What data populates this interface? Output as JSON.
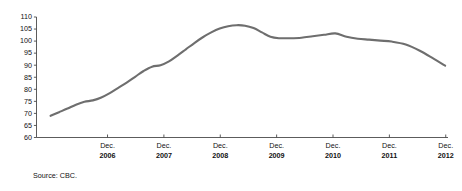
{
  "chart_data": {
    "type": "line",
    "title": "",
    "subtitle": "",
    "xlabel": "",
    "ylabel": "",
    "ylim": [
      60,
      110
    ],
    "yticks": [
      60,
      65,
      70,
      75,
      80,
      85,
      90,
      95,
      100,
      105,
      110
    ],
    "grid": false,
    "legend": null,
    "legend_position": "none",
    "line_color": "#6e6e6e",
    "axis_color": "#4a4a4a",
    "text_color": "#111111",
    "xtick_month": "Dec.",
    "xtick_years": [
      "2006",
      "2007",
      "2008",
      "2009",
      "2010",
      "2011",
      "2012"
    ],
    "x_axis_range_label": [
      "2006",
      "2012"
    ],
    "annotations": [
      {
        "text": "Source: CBC."
      }
    ],
    "series": [
      {
        "name": "index",
        "x": [
          2005.95,
          2006.1,
          2006.25,
          2006.4,
          2006.55,
          2006.7,
          2006.85,
          2007.0,
          2007.15,
          2007.3,
          2007.45,
          2007.6,
          2007.75,
          2007.9,
          2008.05,
          2008.2,
          2008.35,
          2008.5,
          2008.65,
          2008.8,
          2008.95,
          2009.1,
          2009.25,
          2009.4,
          2009.55,
          2009.7,
          2009.85,
          2010.0,
          2010.2,
          2010.4,
          2010.6,
          2010.8,
          2011.0,
          2011.2,
          2011.4,
          2011.6,
          2011.8,
          2012.0,
          2012.25,
          2012.5,
          2012.75,
          2012.95
        ],
        "values": [
          69.0,
          70.5,
          72.0,
          73.6,
          74.8,
          75.4,
          76.6,
          78.4,
          80.6,
          82.8,
          85.2,
          87.6,
          89.4,
          90.0,
          91.6,
          94.0,
          96.6,
          99.2,
          101.6,
          103.6,
          105.2,
          106.2,
          106.6,
          106.4,
          105.4,
          103.6,
          101.8,
          101.2,
          101.2,
          101.4,
          102.0,
          102.6,
          103.2,
          101.8,
          101.0,
          100.6,
          100.2,
          99.8,
          98.6,
          96.0,
          92.6,
          89.8
        ]
      }
    ]
  },
  "source": {
    "label": "Source: CBC."
  }
}
